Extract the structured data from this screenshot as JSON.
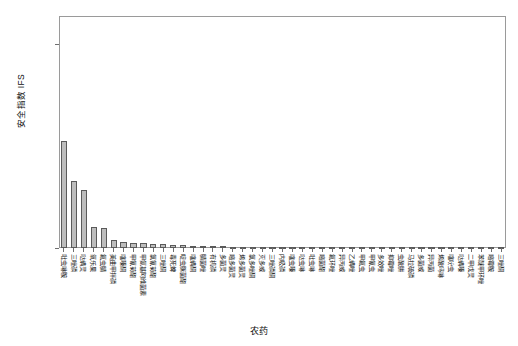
{
  "chart_data": {
    "type": "bar",
    "title": "",
    "subtitle": "",
    "xlabel": "农药",
    "ylabel": "安全指数 IFS",
    "ylim": [
      0.0,
      0.00057
    ],
    "ytick_values": [
      0.0,
      0.0005
    ],
    "ytick_labels": [
      "0.0000",
      "0.0005"
    ],
    "grid": false,
    "legend": null,
    "bar_color": "#bdbdbd",
    "bar_edge_color": "#5a5a5a",
    "axis_color": "#9a9a9a",
    "categories": [
      "吡虫啉胺",
      "三唑磷",
      "哒螨灵",
      "氧乐果",
      "氟虫腈",
      "美曲甲拌磷",
      "噻嗪酮",
      "甲氰菊酯",
      "甲氨基阿维菌素",
      "氯氰菊酯",
      "三唑酮",
      "毒死蜱",
      "啶虫脒菌酯",
      "噻螨酮",
      "腈菌唑",
      "有机磷",
      "多菌灵",
      "嘧多菌灵",
      "烯多菌灵",
      "氯多唑酮",
      "灭多威",
      "三唑磷酮",
      "内吸磷",
      "噻虫嗪",
      "哒虫啉",
      "吡虫啉",
      "嘧菌酯",
      "氟环唑",
      "异丙威",
      "乙螨唑",
      "甲氟虫",
      "甲氰虫",
      "多效唑",
      "抑霉唑",
      "虫酰肼",
      "马拉硫磷",
      "多菌威",
      "异丙菌",
      "烯酰吗啉",
      "噻吩虫",
      "哒螨嗪",
      "二甲戊灵",
      "苯醚甲环唑",
      "嘧霉胺",
      "三唑酮"
    ],
    "values": [
      0.000262,
      0.000165,
      0.000143,
      5.1e-05,
      5e-05,
      1.9e-05,
      1.4e-05,
      1.3e-05,
      1.2e-05,
      1.1e-05,
      9.5e-06,
      8.2e-06,
      7e-06,
      6e-06,
      5.2e-06,
      4.6e-06,
      4e-06,
      3.6e-06,
      3.2e-06,
      2.9e-06,
      2.6e-06,
      2.4e-06,
      2.2e-06,
      2e-06,
      1.8e-06,
      1.7e-06,
      1.6e-06,
      1.5e-06,
      1.4e-06,
      1.3e-06,
      1.2e-06,
      1.1e-06,
      1e-06,
      9.5e-07,
      9e-07,
      8.5e-07,
      8e-07,
      7.5e-07,
      7e-07,
      6.5e-07,
      6e-07,
      5.5e-07,
      5e-07,
      4.5e-07,
      4e-07
    ]
  },
  "plot_geometry": {
    "left": 59,
    "right": 506,
    "top": 16,
    "bottom": 248
  }
}
